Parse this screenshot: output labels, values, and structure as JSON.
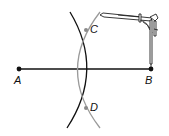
{
  "diagram": {
    "points": {
      "A": {
        "label": "A",
        "x": 19,
        "y": 69
      },
      "B": {
        "label": "B",
        "x": 151,
        "y": 69
      },
      "C": {
        "label": "C",
        "x": 86,
        "y": 30
      },
      "D": {
        "label": "D",
        "x": 86,
        "y": 108
      }
    },
    "segment": {
      "from": "A",
      "to": "B"
    },
    "arcs": [
      {
        "center": "A",
        "color": "#111111",
        "description": "dark arc through C and D"
      },
      {
        "center": "B",
        "color": "#999999",
        "description": "gray arc through C and D"
      }
    ],
    "tool": "compass",
    "colors": {
      "line": "#111111",
      "arc_gray": "#999999",
      "point_gray": "#8a8a8a"
    }
  }
}
